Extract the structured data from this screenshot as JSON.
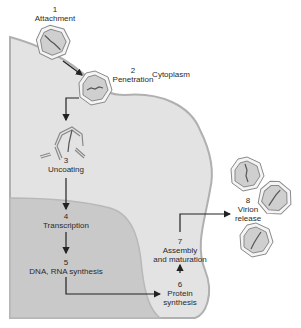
{
  "diagram": {
    "regions": {
      "cytoplasm_label": "Cytoplasm"
    },
    "steps": [
      {
        "number": "1",
        "label": "Attachment"
      },
      {
        "number": "2",
        "label": "Penetration"
      },
      {
        "number": "3",
        "label": "Uncoating"
      },
      {
        "number": "4",
        "label": "Transcription"
      },
      {
        "number": "5",
        "label": "DNA, RNA synthesis"
      },
      {
        "number": "6",
        "label_line1": "Protein",
        "label_line2": "synthesis"
      },
      {
        "number": "7",
        "label_line1": "Assembly",
        "label_line2": "and maturation"
      },
      {
        "number": "8",
        "label_line1": "Virion",
        "label_line2": "release"
      }
    ],
    "colors": {
      "background": "#ffffff",
      "cytoplasm": "#e3e3e3",
      "nucleus": "#c9c9c9",
      "membrane": "#b0b0b0",
      "virion_fill": "#cfcfcf",
      "arrow": "#222222",
      "text": "#2a2a2a"
    }
  }
}
